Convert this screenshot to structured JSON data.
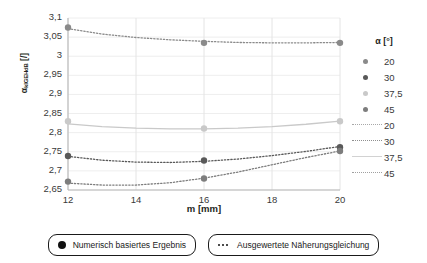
{
  "chart_data": {
    "type": "line",
    "title": "",
    "xlabel": "m [mm]",
    "ylabel_main": "α",
    "ylabel_sub": "kIGEHdB",
    "ylabel_unit": "[/]",
    "ylabel_full": "αkIGEHdB [/]",
    "xlim": [
      12,
      20
    ],
    "ylim": [
      2.65,
      3.1
    ],
    "xticks": [
      "12",
      "14",
      "16",
      "18",
      "20"
    ],
    "xtick_values": [
      12,
      14,
      16,
      18,
      20
    ],
    "yticks": [
      "2,65",
      "2,7",
      "2,75",
      "2,8",
      "2,85",
      "2,9",
      "2,95",
      "3",
      "3,05",
      "3,1"
    ],
    "ytick_values": [
      2.65,
      2.7,
      2.75,
      2.8,
      2.85,
      2.9,
      2.95,
      3.0,
      3.05,
      3.1
    ],
    "grid": true,
    "legend_position": "right",
    "legend_title": "α [°]",
    "series": [
      {
        "name": "20",
        "color": "#8a8a8a",
        "style": "dotted",
        "marker_points": [
          {
            "x": 12,
            "y": 3.075
          },
          {
            "x": 16,
            "y": 3.035
          },
          {
            "x": 20,
            "y": 3.035
          }
        ],
        "curve": [
          {
            "x": 12.0,
            "y": 3.072
          },
          {
            "x": 13.0,
            "y": 3.058
          },
          {
            "x": 14.0,
            "y": 3.049
          },
          {
            "x": 15.0,
            "y": 3.043
          },
          {
            "x": 16.0,
            "y": 3.039
          },
          {
            "x": 17.0,
            "y": 3.036
          },
          {
            "x": 18.0,
            "y": 3.035
          },
          {
            "x": 19.0,
            "y": 3.035
          },
          {
            "x": 20.0,
            "y": 3.036
          }
        ]
      },
      {
        "name": "30",
        "color": "#595959",
        "style": "dotted",
        "marker_points": [
          {
            "x": 12,
            "y": 2.739
          },
          {
            "x": 16,
            "y": 2.727
          },
          {
            "x": 20,
            "y": 2.762
          }
        ],
        "curve": [
          {
            "x": 12.0,
            "y": 2.738
          },
          {
            "x": 13.0,
            "y": 2.728
          },
          {
            "x": 14.0,
            "y": 2.723
          },
          {
            "x": 15.0,
            "y": 2.722
          },
          {
            "x": 16.0,
            "y": 2.725
          },
          {
            "x": 17.0,
            "y": 2.731
          },
          {
            "x": 18.0,
            "y": 2.74
          },
          {
            "x": 19.0,
            "y": 2.751
          },
          {
            "x": 20.0,
            "y": 2.764
          }
        ]
      },
      {
        "name": "37,5",
        "color": "#c9c9c9",
        "style": "solid",
        "marker_points": [
          {
            "x": 12,
            "y": 2.83
          },
          {
            "x": 16,
            "y": 2.811
          },
          {
            "x": 20,
            "y": 2.83
          }
        ],
        "curve": [
          {
            "x": 12.0,
            "y": 2.823
          },
          {
            "x": 13.0,
            "y": 2.816
          },
          {
            "x": 14.0,
            "y": 2.812
          },
          {
            "x": 15.0,
            "y": 2.81
          },
          {
            "x": 16.0,
            "y": 2.81
          },
          {
            "x": 17.0,
            "y": 2.812
          },
          {
            "x": 18.0,
            "y": 2.816
          },
          {
            "x": 19.0,
            "y": 2.822
          },
          {
            "x": 20.0,
            "y": 2.83
          }
        ]
      },
      {
        "name": "45",
        "color": "#7d7d7d",
        "style": "dotted",
        "marker_points": [
          {
            "x": 12,
            "y": 2.672
          },
          {
            "x": 16,
            "y": 2.68
          },
          {
            "x": 20,
            "y": 2.752
          }
        ],
        "curve": [
          {
            "x": 12.0,
            "y": 2.668
          },
          {
            "x": 13.0,
            "y": 2.663
          },
          {
            "x": 14.0,
            "y": 2.663
          },
          {
            "x": 15.0,
            "y": 2.669
          },
          {
            "x": 16.0,
            "y": 2.681
          },
          {
            "x": 17.0,
            "y": 2.697
          },
          {
            "x": 18.0,
            "y": 2.716
          },
          {
            "x": 19.0,
            "y": 2.735
          },
          {
            "x": 20.0,
            "y": 2.752
          }
        ]
      }
    ]
  },
  "legend": {
    "title": "α [°]",
    "marker_entries": [
      {
        "label": "20",
        "color": "#8a8a8a"
      },
      {
        "label": "30",
        "color": "#595959"
      },
      {
        "label": "37,5",
        "color": "#c9c9c9"
      },
      {
        "label": "45",
        "color": "#7d7d7d"
      }
    ],
    "line_entries": [
      {
        "label": "20",
        "color": "#a8a8a8",
        "style": "dotted"
      },
      {
        "label": "30",
        "color": "#8f8f8f",
        "style": "dotted"
      },
      {
        "label": "37,5",
        "color": "#d2d2d2",
        "style": "solid"
      },
      {
        "label": "45",
        "color": "#a0a0a0",
        "style": "dotted"
      }
    ]
  },
  "bottom_legend": {
    "items": [
      {
        "icon": "filled-circle-icon",
        "label": "Numerisch basiertes Ergebnis"
      },
      {
        "icon": "dotted-line-icon",
        "label": "Ausgewertete Näherungsgleichung"
      }
    ]
  }
}
